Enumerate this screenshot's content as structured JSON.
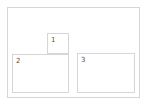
{
  "colors": {
    "border": "#d6d6d6",
    "label": "#555555",
    "background": "#ffffff"
  },
  "container": {
    "x": 7,
    "y": 7,
    "w": 133,
    "h": 91
  },
  "boxes": [
    {
      "label": "1",
      "x": 47,
      "y": 33,
      "w": 22,
      "h": 21
    },
    {
      "label": "2",
      "x": 12,
      "y": 54,
      "w": 57,
      "h": 39
    },
    {
      "label": "3",
      "x": 77,
      "y": 53,
      "w": 58,
      "h": 40
    }
  ]
}
